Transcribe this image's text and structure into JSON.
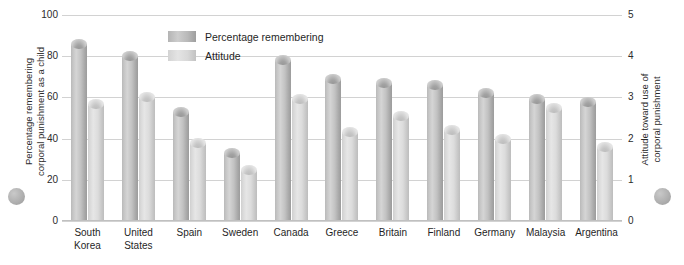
{
  "chart_data": {
    "type": "bar",
    "title": "",
    "subtitle": "",
    "categories": [
      "South Korea",
      "United States",
      "Spain",
      "Sweden",
      "Canada",
      "Greece",
      "Britain",
      "Finland",
      "Germany",
      "Malaysia",
      "Argentina"
    ],
    "series": [
      {
        "name": "Percentage remembering",
        "axis": "left",
        "color": "#b9b9b9",
        "values": [
          86,
          80,
          53,
          33,
          78,
          69,
          67,
          66,
          62,
          59,
          58
        ]
      },
      {
        "name": "Attitude",
        "axis": "right",
        "color": "#d9d9d9",
        "values": [
          57,
          60,
          38,
          25,
          59,
          43,
          51,
          44,
          40,
          55,
          36
        ]
      }
    ],
    "xlabel": "",
    "ylabel": "Percentage remembering corporal punishment as a child",
    "y2label": "Attitude toward use of corporal punishment",
    "ylim": [
      0,
      100
    ],
    "y2lim": [
      0,
      5
    ],
    "yticks": [
      0,
      20,
      40,
      60,
      80,
      100
    ],
    "y2ticks": [
      0,
      1,
      2,
      3,
      4,
      5
    ],
    "grid": true,
    "legend_position": "top-center"
  },
  "axes": {
    "left": {
      "title_line1": "Percentage remembering",
      "title_line2": "corporal punishment as a child",
      "ticks": [
        "100",
        "80",
        "60",
        "40",
        "20",
        "0"
      ]
    },
    "right": {
      "title_line1": "Attitude toward use of",
      "title_line2": "corporal punishment",
      "ticks": [
        "5",
        "4",
        "3",
        "2",
        "1",
        "0"
      ]
    }
  },
  "legend": {
    "items": [
      {
        "label": "Percentage remembering",
        "swatch": "dark"
      },
      {
        "label": "Attitude",
        "swatch": "light"
      }
    ]
  },
  "categories": [
    {
      "line1": "South",
      "line2": "Korea"
    },
    {
      "line1": "United",
      "line2": "States"
    },
    {
      "line1": "Spain",
      "line2": ""
    },
    {
      "line1": "Sweden",
      "line2": ""
    },
    {
      "line1": "Canada",
      "line2": ""
    },
    {
      "line1": "Greece",
      "line2": ""
    },
    {
      "line1": "Britain",
      "line2": ""
    },
    {
      "line1": "Finland",
      "line2": ""
    },
    {
      "line1": "Germany",
      "line2": ""
    },
    {
      "line1": "Malaysia",
      "line2": ""
    },
    {
      "line1": "Argentina",
      "line2": ""
    }
  ]
}
